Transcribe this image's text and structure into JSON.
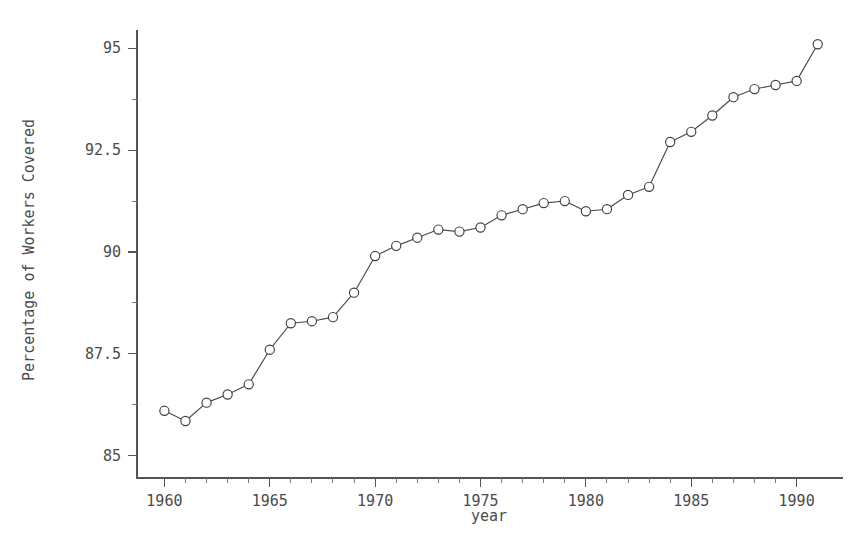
{
  "chart_data": {
    "type": "line",
    "title": "",
    "subtitle": "",
    "xlabel": "year",
    "ylabel": "Percentage of Workers Covered",
    "x": [
      1960,
      1961,
      1962,
      1963,
      1964,
      1965,
      1966,
      1967,
      1968,
      1969,
      1970,
      1971,
      1972,
      1973,
      1974,
      1975,
      1976,
      1977,
      1978,
      1979,
      1980,
      1981,
      1982,
      1983,
      1984,
      1985,
      1986,
      1987,
      1988,
      1989,
      1990,
      1991
    ],
    "values": [
      86.1,
      85.85,
      86.3,
      86.5,
      86.75,
      87.6,
      88.25,
      88.3,
      88.4,
      89.0,
      89.9,
      90.15,
      90.35,
      90.55,
      90.5,
      90.6,
      90.9,
      91.05,
      91.2,
      91.25,
      91.0,
      91.05,
      91.4,
      91.6,
      92.7,
      92.95,
      93.35,
      93.8,
      94.0,
      94.1,
      94.2,
      95.1
    ],
    "series": [
      {
        "name": "Percentage of Workers Covered",
        "values": [
          86.1,
          85.85,
          86.3,
          86.5,
          86.75,
          87.6,
          88.25,
          88.3,
          88.4,
          89.0,
          89.9,
          90.15,
          90.35,
          90.55,
          90.5,
          90.6,
          90.9,
          91.05,
          91.2,
          91.25,
          91.0,
          91.05,
          91.4,
          91.6,
          92.7,
          92.95,
          93.35,
          93.8,
          94.0,
          94.1,
          94.2,
          95.1
        ],
        "marker": "open-circle",
        "color": "#3f3f3f"
      }
    ],
    "xlim": [
      1958.7,
      1992.2
    ],
    "ylim": [
      84.45,
      95.45
    ],
    "x_ticks": [
      1960,
      1965,
      1970,
      1975,
      1980,
      1985,
      1990
    ],
    "x_tick_labels": [
      "1960",
      "1965",
      "1970",
      "1975",
      "1980",
      "1985",
      "1990"
    ],
    "x_minor_tick_step": 1,
    "y_ticks": [
      85,
      87.5,
      90,
      92.5,
      95
    ],
    "y_tick_labels": [
      "85",
      "87.5",
      "90",
      "92.5",
      "95"
    ],
    "y_minor_ticks": [
      86.25,
      88.75,
      91.25,
      93.75
    ],
    "grid": false,
    "legend": false,
    "legend_position": "none",
    "background_color": "#ffffff",
    "axis_color": "#555555",
    "line_color": "#4a4a4a",
    "marker_face_color": "#ffffff"
  }
}
